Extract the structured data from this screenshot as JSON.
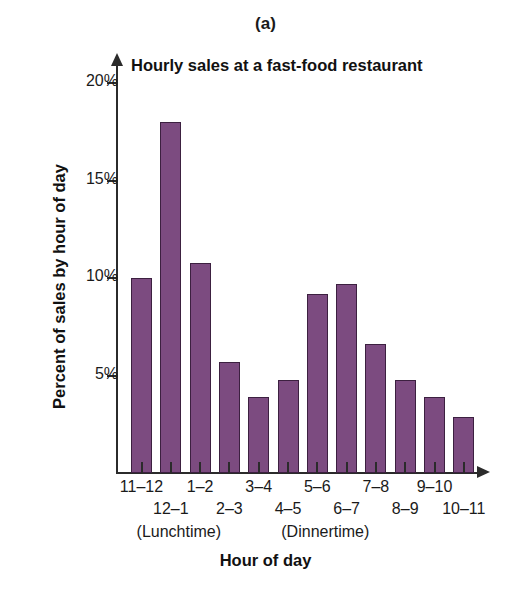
{
  "figure": {
    "panel_letter": "(a)",
    "axis_label_x": "Hour of day",
    "axis_label_y": "Percent of sales by hour of day",
    "group_notes": [
      {
        "text": "(Lunchtime)",
        "center_index": 1
      },
      {
        "text": "(Dinnertime)",
        "center_index": 6
      }
    ]
  },
  "chart_data": {
    "type": "bar",
    "title": "Hourly sales at a fast-food restaurant",
    "xlabel": "Hour of day",
    "ylabel": "Percent of sales by hour of day",
    "categories": [
      "11–12",
      "12–1",
      "1–2",
      "2–3",
      "3–4",
      "4–5",
      "5–6",
      "6–7",
      "7–8",
      "8–9",
      "9–10",
      "10–11"
    ],
    "values": [
      10.0,
      18.0,
      10.8,
      5.7,
      3.9,
      4.8,
      9.2,
      9.7,
      6.6,
      4.8,
      3.9,
      2.9
    ],
    "ylim": [
      0,
      21
    ],
    "yticks": [
      5,
      10,
      15,
      20
    ],
    "ytick_labels": [
      "5%",
      "10%",
      "15%",
      "20%"
    ],
    "grid": false,
    "legend": "none",
    "bar_color": "#7c4b80",
    "bar_edge_color": "#3c2040",
    "annotations": [
      "(Lunchtime)",
      "(Dinnertime)",
      "(a)"
    ]
  }
}
